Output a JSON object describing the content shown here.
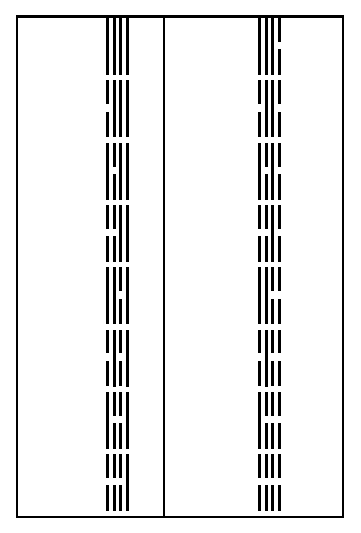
{
  "diagram": {
    "line_color": "#000000",
    "background": "#ffffff",
    "encoding": "Each figure has 4 vertical lines ordered left to right; line 1 is least significant bit; solid = 0, broken = 1",
    "columns": [
      {
        "id": "left",
        "groups": [
          {
            "index": 0,
            "lines": [
              "solid",
              "solid",
              "solid",
              "solid"
            ]
          },
          {
            "index": 1,
            "lines": [
              "broken",
              "solid",
              "solid",
              "solid"
            ]
          },
          {
            "index": 2,
            "lines": [
              "solid",
              "broken",
              "solid",
              "solid"
            ]
          },
          {
            "index": 3,
            "lines": [
              "broken",
              "broken",
              "solid",
              "solid"
            ]
          },
          {
            "index": 4,
            "lines": [
              "solid",
              "solid",
              "broken",
              "solid"
            ]
          },
          {
            "index": 5,
            "lines": [
              "broken",
              "solid",
              "broken",
              "solid"
            ]
          },
          {
            "index": 6,
            "lines": [
              "solid",
              "broken",
              "broken",
              "solid"
            ]
          },
          {
            "index": 7,
            "lines": [
              "broken",
              "broken",
              "broken",
              "solid"
            ]
          }
        ]
      },
      {
        "id": "right",
        "groups": [
          {
            "index": 8,
            "lines": [
              "solid",
              "solid",
              "solid",
              "broken"
            ]
          },
          {
            "index": 9,
            "lines": [
              "broken",
              "solid",
              "solid",
              "broken"
            ]
          },
          {
            "index": 10,
            "lines": [
              "solid",
              "broken",
              "solid",
              "broken"
            ]
          },
          {
            "index": 11,
            "lines": [
              "broken",
              "broken",
              "solid",
              "broken"
            ]
          },
          {
            "index": 12,
            "lines": [
              "solid",
              "solid",
              "broken",
              "broken"
            ]
          },
          {
            "index": 13,
            "lines": [
              "broken",
              "solid",
              "broken",
              "broken"
            ]
          },
          {
            "index": 14,
            "lines": [
              "solid",
              "broken",
              "broken",
              "broken"
            ]
          },
          {
            "index": 15,
            "lines": [
              "broken",
              "broken",
              "broken",
              "broken"
            ]
          }
        ]
      }
    ]
  }
}
